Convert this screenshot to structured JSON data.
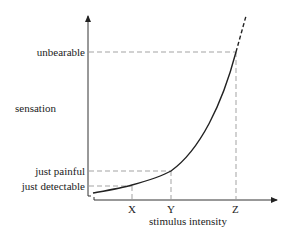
{
  "diagram": {
    "y_axis_label": "sensation",
    "x_axis_label": "stimulus intensity",
    "y_levels": [
      {
        "label": "unbearable",
        "y": 52
      },
      {
        "label": "just painful",
        "y": 171
      },
      {
        "label": "just detectable",
        "y": 186
      }
    ],
    "x_points": [
      {
        "label": "X",
        "x": 132
      },
      {
        "label": "Y",
        "x": 171
      },
      {
        "label": "Z",
        "x": 236
      }
    ],
    "curve": "exponential increase of sensation with stimulus intensity",
    "colors": {
      "line": "#222222",
      "guide": "#9a9a9a"
    }
  }
}
